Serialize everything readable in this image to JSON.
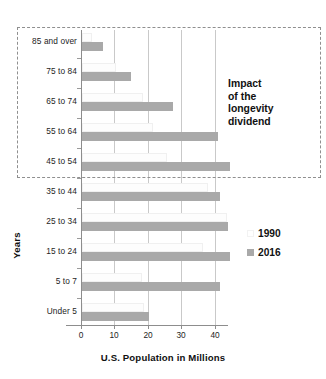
{
  "chart_data": {
    "type": "bar",
    "orientation": "horizontal",
    "title": "",
    "xlabel": "U.S. Population in Millions",
    "ylabel": "Years",
    "xlim": [
      0,
      42
    ],
    "xticks": [
      0,
      10,
      20,
      30,
      40
    ],
    "xtick_labels": [
      "0",
      "10",
      "20",
      "30",
      "40"
    ],
    "grid": true,
    "grid_axis": "x",
    "legend_position": "right",
    "categories": [
      "85 and over",
      "75 to 84",
      "65 to 74",
      "55 to 64",
      "45 to 54",
      "35 to 44",
      "25 to 34",
      "15 to 24",
      "5 to 7",
      "Under 5"
    ],
    "series": [
      {
        "name": "1990",
        "color": "#ffffff",
        "values": [
          3.1,
          10.1,
          18.1,
          21.1,
          25.2,
          37.6,
          43.2,
          36.0,
          18.0,
          18.4
        ]
      },
      {
        "name": "2016",
        "color": "#a9a9a9",
        "values": [
          6.3,
          14.5,
          27.0,
          40.5,
          44.0,
          41.0,
          43.5,
          44.0,
          41.0,
          20.0
        ]
      }
    ],
    "annotations": [
      {
        "name": "longevity-dividend-callout",
        "text": "Impact of the longevity dividend",
        "lines": [
          "Impact",
          "of the",
          "longevity",
          "dividend"
        ],
        "style": "dashed-box",
        "box_color": "#8f8f8f",
        "covers_categories": [
          "85 and over",
          "75 to 84",
          "65 to 74",
          "55 to 64",
          "45 to 54"
        ]
      }
    ]
  },
  "legend": {
    "entries": [
      {
        "label": "1990",
        "swatch": "#ffffff"
      },
      {
        "label": "2016",
        "swatch": "#a9a9a9"
      }
    ]
  }
}
